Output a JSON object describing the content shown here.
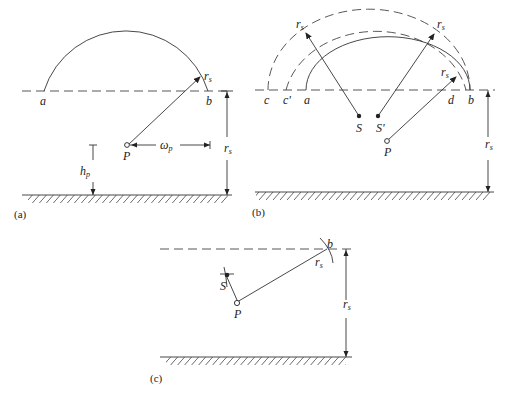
{
  "panels": {
    "a": {
      "caption": "(a)",
      "labels": {
        "a": "a",
        "b": "b",
        "P": "P",
        "rs_arc": "r",
        "rs_arc_sub": "s",
        "rs_dim": "r",
        "rs_dim_sub": "s",
        "wp": "ω",
        "wp_sub": "p",
        "hp": "h",
        "hp_sub": "p"
      }
    },
    "b": {
      "caption": "(b)",
      "labels": {
        "c": "c",
        "c_prime": "c'",
        "a": "a",
        "d": "d",
        "b": "b",
        "S": "S",
        "S_prime": "S'",
        "P": "P",
        "rs1": "r",
        "rs2": "r",
        "rs3": "r",
        "rs_dim": "r",
        "sub": "s"
      }
    },
    "c": {
      "caption": "(c)",
      "labels": {
        "b": "b",
        "S": "S",
        "P": "P",
        "rs_line": "r",
        "rs_dim": "r",
        "sub": "s"
      }
    }
  }
}
